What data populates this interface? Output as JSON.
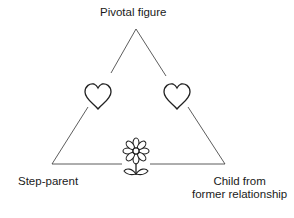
{
  "diagram": {
    "title": "",
    "nodes": {
      "top": "Pivotal figure",
      "left": "Step-parent",
      "right_line1": "Child from",
      "right_line2": "former relationship"
    },
    "edge_icons": {
      "left_edge": "heart-icon",
      "right_edge": "heart-icon",
      "bottom_edge": "flower-icon"
    }
  }
}
